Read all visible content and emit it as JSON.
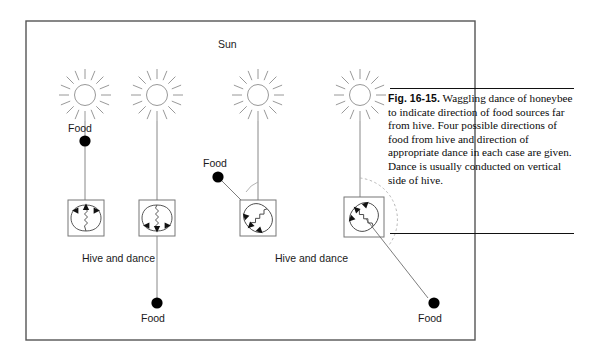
{
  "figure": {
    "id": "fig-16-15",
    "number_label": "Fig. 16-15.",
    "caption_text": "Waggling dance of honeybee to indicate direction of food sources far from hive. Four possible directions of food from hive and direction of appropriate dance in each case are given. Dance is usually conducted on vertical side of hive.",
    "border_color": "#555555",
    "ink_color": "#1a1a1a",
    "sun_ray_color": "#888888",
    "dot_color": "#000000"
  },
  "labels": {
    "sun": "Sun",
    "food": "Food",
    "hive_and_dance": "Hive and dance"
  },
  "panels": [
    {
      "id": "panel-1",
      "sun_label": "Sun",
      "food_label": "Food",
      "hive_label": "Hive and dance",
      "food_direction": "toward-sun",
      "dance_direction": "upward",
      "angle_degrees": 0
    },
    {
      "id": "panel-2",
      "sun_label": "Sun",
      "food_label": "Food",
      "hive_label": "Hive and dance",
      "food_direction": "away-from-sun",
      "dance_direction": "downward",
      "angle_degrees": 180
    },
    {
      "id": "panel-3",
      "sun_label": "Sun",
      "food_label": "Food",
      "hive_label": "Hive and dance",
      "food_direction": "left-of-sun",
      "dance_direction": "tilted-left",
      "angle_degrees": 45
    },
    {
      "id": "panel-4",
      "sun_label": "Sun",
      "food_label": "Food",
      "hive_label": "Hive and dance",
      "food_direction": "right-below-sun",
      "dance_direction": "tilted-right",
      "angle_degrees": 135
    }
  ]
}
